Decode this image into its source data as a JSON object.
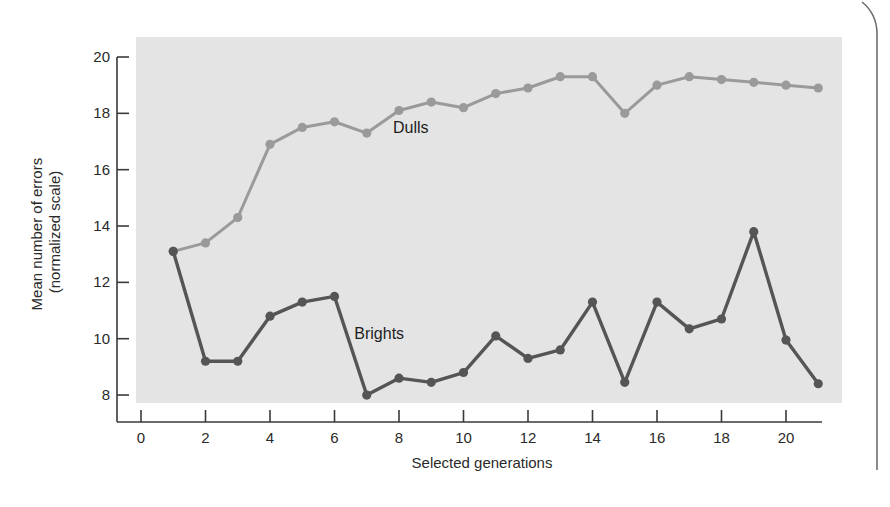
{
  "chart_data": {
    "type": "line",
    "title": "",
    "xlabel": "Selected generations",
    "ylabel": "Mean number of errors\n(normalized scale)",
    "ylabel_lines": [
      "Mean number of errors",
      "(normalized scale)"
    ],
    "xlim": [
      0,
      21
    ],
    "ylim": [
      8,
      20
    ],
    "xticks": [
      0,
      2,
      4,
      6,
      8,
      10,
      12,
      14,
      16,
      18,
      20
    ],
    "yticks": [
      8,
      10,
      12,
      14,
      16,
      18,
      20
    ],
    "grid": false,
    "legend": "inline labels",
    "x": [
      1,
      2,
      3,
      4,
      5,
      6,
      7,
      8,
      9,
      10,
      11,
      12,
      13,
      14,
      15,
      16,
      17,
      18,
      19,
      20,
      21
    ],
    "series": [
      {
        "name": "Dulls",
        "color": "#9a9a9a",
        "label_pos": [
          8,
          17.5
        ],
        "values": [
          13.1,
          13.4,
          14.3,
          16.9,
          17.5,
          17.7,
          17.3,
          18.1,
          18.4,
          18.2,
          18.7,
          18.9,
          19.3,
          19.3,
          18.0,
          19.0,
          19.3,
          19.2,
          19.1,
          19.0,
          18.9
        ]
      },
      {
        "name": "Brights",
        "color": "#555555",
        "label_pos": [
          6.8,
          10.2
        ],
        "values": [
          13.1,
          9.2,
          9.2,
          10.8,
          11.3,
          11.5,
          8.0,
          8.6,
          8.45,
          8.8,
          10.1,
          9.3,
          9.6,
          11.3,
          8.45,
          11.3,
          10.35,
          10.7,
          13.8,
          9.95,
          8.4
        ]
      }
    ]
  },
  "colors": {
    "plot_background": "#e4e4e4",
    "axis": "#3a3a3a",
    "frame_bracket": "#6e6e6e"
  }
}
